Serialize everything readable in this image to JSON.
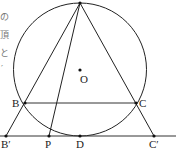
{
  "diagram": {
    "type": "geometry",
    "circle": {
      "center_label": "O",
      "cx": 80,
      "cy": 69,
      "r": 66
    },
    "points": {
      "A": {
        "label": "A",
        "x": 80,
        "y": 3
      },
      "O": {
        "label": "O",
        "x": 80,
        "y": 70
      },
      "B": {
        "label": "B",
        "x": 25,
        "y": 103
      },
      "C": {
        "label": "C",
        "x": 136,
        "y": 103
      },
      "B_prime": {
        "label": "B′",
        "x": 6,
        "y": 136
      },
      "P": {
        "label": "P",
        "x": 49,
        "y": 136
      },
      "D": {
        "label": "D",
        "x": 80,
        "y": 136
      },
      "C_prime": {
        "label": "C′",
        "x": 154,
        "y": 136
      }
    },
    "segments": [
      "AB'",
      "AC'",
      "AP",
      "BC",
      "B'C' (tangent line at D)"
    ],
    "side_text_fragments": [
      "の",
      "頂",
      "と",
      "′"
    ]
  }
}
